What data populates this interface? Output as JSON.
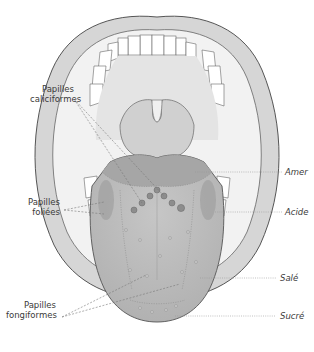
{
  "diagram": {
    "labels_left": [
      {
        "id": "caliciformes",
        "line1": "Papilles",
        "line2": "caliciformes"
      },
      {
        "id": "foliees",
        "line1": "Papilles",
        "line2": "foliées"
      },
      {
        "id": "fongiformes",
        "line1": "Papilles",
        "line2": "fongiformes"
      }
    ],
    "labels_right": [
      {
        "id": "amer",
        "text": "Amer"
      },
      {
        "id": "acide",
        "text": "Acide"
      },
      {
        "id": "sale",
        "text": "Salé"
      },
      {
        "id": "sucre",
        "text": "Sucré"
      }
    ],
    "colors": {
      "outline": "#555555",
      "lip": "#d4d4d4",
      "palate": "#e6e6e6",
      "tongue": "#bdbdbd",
      "tongue_back": "#a8a8a8",
      "leader": "#777777",
      "text": "#3a3a3a"
    }
  }
}
